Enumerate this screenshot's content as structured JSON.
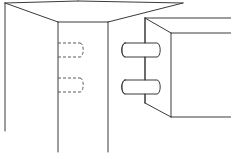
{
  "figure": {
    "type": "line-drawing",
    "width": 231,
    "height": 153,
    "background_color": "#ffffff",
    "line_color": "#3a3a3a",
    "hidden_line_color": "#5a5a5a",
    "line_width": 1,
    "hidden_line_dash": "3 2"
  },
  "left_part": {
    "name": "mortise board with hidden dowel holes",
    "description": "Box shown in isometric view, open at bottom, with two hidden cylindrical holes drawn as dashed outlines on the right face",
    "outline": {
      "top_face": "5,3 108,22 183,3 78,1",
      "front_left_vertical": "5,3 5,130",
      "front_right_vertical": "58,22 58,152",
      "side_vertical": "108,22 108,152",
      "top_front_edge": "5,3 58,22",
      "top_right_edge": "58,22 108,22"
    },
    "hidden_holes": [
      {
        "name": "upper-dowel-hole",
        "top_y": 43,
        "bottom_y": 57,
        "left_x": 58,
        "right_x": 82,
        "cap_rx": 3,
        "cap_ry": 7
      },
      {
        "name": "lower-dowel-hole",
        "top_y": 78,
        "bottom_y": 92,
        "left_x": 58,
        "right_x": 82,
        "cap_rx": 3,
        "cap_ry": 7
      }
    ]
  },
  "right_part": {
    "name": "tenon board with protruding dowels",
    "description": "Box shown in isometric view with two cylindrical dowel pins projecting from its left face",
    "outline": {
      "left_vertical": "145,18 145,103",
      "top_bevel": "145,18 171,33",
      "bottom_bevel": "145,103 171,117",
      "face_right_vertical": "171,33 171,117",
      "top_far_edge": "145,18 231,18",
      "top_near_edge": "171,33 231,33",
      "bottom_near_edge": "171,117 231,117"
    },
    "dowels": [
      {
        "name": "upper-dowel-pin",
        "axis_y": 50,
        "left_x": 122,
        "right_x": 159,
        "half_height": 7,
        "cap_rx": 3,
        "cap_ry": 7
      },
      {
        "name": "lower-dowel-pin",
        "axis_y": 87,
        "left_x": 122,
        "right_x": 159,
        "half_height": 7,
        "cap_rx": 3,
        "cap_ry": 7
      }
    ]
  }
}
